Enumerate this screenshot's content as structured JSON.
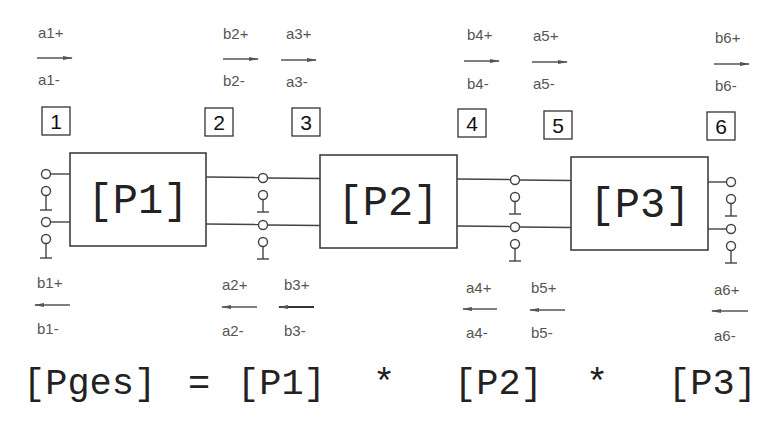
{
  "diagram": {
    "colors": {
      "line": "#444444",
      "label_text": "#555555",
      "box_text": "#222222",
      "background": "#ffffff"
    },
    "ports": [
      {
        "number": "1",
        "top_plus": "a1+",
        "top_minus": "a1-",
        "top_arrow": "right",
        "bottom_plus": "b1+",
        "bottom_minus": "b1-",
        "bottom_arrow": "left"
      },
      {
        "number": "2",
        "top_plus": "b2+",
        "top_minus": "b2-",
        "top_arrow": "right",
        "bottom_plus": "a2+",
        "bottom_minus": "a2-",
        "bottom_arrow": "left"
      },
      {
        "number": "3",
        "top_plus": "a3+",
        "top_minus": "a3-",
        "top_arrow": "right",
        "bottom_plus": "b3+",
        "bottom_minus": "b3-",
        "bottom_arrow": "left"
      },
      {
        "number": "4",
        "top_plus": "b4+",
        "top_minus": "b4-",
        "top_arrow": "right",
        "bottom_plus": "a4+",
        "bottom_minus": "a4-",
        "bottom_arrow": "left"
      },
      {
        "number": "5",
        "top_plus": "a5+",
        "top_minus": "a5-",
        "top_arrow": "right",
        "bottom_plus": "b5+",
        "bottom_minus": "b5-",
        "bottom_arrow": "left"
      },
      {
        "number": "6",
        "top_plus": "b6+",
        "top_minus": "b6-",
        "top_arrow": "right",
        "bottom_plus": "a6+",
        "bottom_minus": "a6-",
        "bottom_arrow": "left"
      }
    ],
    "blocks": [
      {
        "label": "[P1]"
      },
      {
        "label": "[P2]"
      },
      {
        "label": "[P3]"
      }
    ],
    "formula": {
      "lhs": "[Pges]",
      "equals": "=",
      "terms": [
        "[P1]",
        "[P2]",
        "[P3]"
      ],
      "operator": "*"
    }
  }
}
